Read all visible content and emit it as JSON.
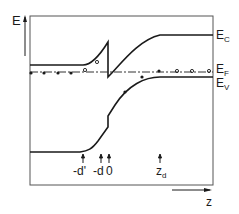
{
  "figure": {
    "axis_y_label": "E",
    "axis_x_label": "z",
    "bands": [
      {
        "id": "ec",
        "label_main": "E",
        "label_sub": "C"
      },
      {
        "id": "ef",
        "label_main": "E",
        "label_sub": "F"
      },
      {
        "id": "ev",
        "label_main": "E",
        "label_sub": "V"
      }
    ],
    "markers": [
      {
        "label": "-d'"
      },
      {
        "label": "-d"
      },
      {
        "label": "0"
      },
      {
        "label_main": "z",
        "label_sub": "d"
      }
    ],
    "colors": {
      "line": "#1a1a1a",
      "background": "#ffffff"
    }
  }
}
